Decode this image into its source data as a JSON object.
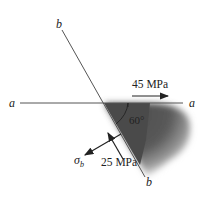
{
  "diagram": {
    "labels": {
      "b_top": "b",
      "b_bottom": "b",
      "a_left": "a",
      "a_right": "a",
      "stress_horizontal": "45 MPa",
      "stress_shear": "25 MPa",
      "angle": "60°",
      "sigma": "σ",
      "sigma_sub": "b"
    },
    "colors": {
      "line": "#555555",
      "shade_dark": "#4a4a4a",
      "arrow": "#222222"
    }
  }
}
